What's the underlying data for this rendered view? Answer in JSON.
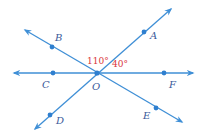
{
  "diagram": {
    "colors": {
      "line": "#3f8fd6",
      "point": "#2f7fcf",
      "point_label": "#3a5a9a",
      "angle_label": "#d9353a",
      "background": "#ffffff"
    },
    "center": {
      "name": "O",
      "x": 97,
      "y": 73
    },
    "lines": [
      {
        "name": "line-CF",
        "through": [
          "C",
          "O",
          "F"
        ],
        "from": [
          14,
          73
        ],
        "to": [
          193,
          73
        ],
        "arrows": "both"
      },
      {
        "name": "line-AD",
        "through": [
          "A",
          "O",
          "D"
        ],
        "from": [
          35,
          129
        ],
        "to": [
          171,
          9
        ],
        "arrows": "both"
      },
      {
        "name": "line-BE",
        "through": [
          "B",
          "O",
          "E"
        ],
        "from": [
          25,
          30
        ],
        "to": [
          182,
          122
        ],
        "arrows": "both"
      }
    ],
    "points": [
      {
        "name": "A",
        "x": 144,
        "y": 32,
        "label_x": 150,
        "label_y": 39
      },
      {
        "name": "B",
        "x": 52,
        "y": 47,
        "label_x": 55,
        "label_y": 41
      },
      {
        "name": "C",
        "x": 53,
        "y": 73,
        "label_x": 42,
        "label_y": 88
      },
      {
        "name": "O",
        "x": 97,
        "y": 73,
        "label_x": 92,
        "label_y": 90
      },
      {
        "name": "F",
        "x": 164,
        "y": 73,
        "label_x": 169,
        "label_y": 88
      },
      {
        "name": "D",
        "x": 50,
        "y": 115,
        "label_x": 56,
        "label_y": 124
      },
      {
        "name": "E",
        "x": 156,
        "y": 108,
        "label_x": 143,
        "label_y": 119
      }
    ],
    "angles": [
      {
        "name": "angle-BOA",
        "text": "110°",
        "value": 110,
        "x": 87,
        "y": 64
      },
      {
        "name": "angle-AOF",
        "text": "40°",
        "value": 40,
        "x": 112,
        "y": 67
      }
    ]
  }
}
